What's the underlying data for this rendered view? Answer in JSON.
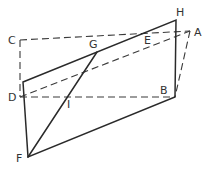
{
  "diagram": {
    "type": "geometry-figure",
    "points": {
      "A": {
        "label": "A",
        "x": 190,
        "y": 31
      },
      "B": {
        "label": "B",
        "x": 175,
        "y": 97
      },
      "C": {
        "label": "C",
        "x": 20,
        "y": 40
      },
      "D": {
        "label": "D",
        "x": 20,
        "y": 97
      },
      "E": {
        "label": "E",
        "x": 148,
        "y": 34
      },
      "F": {
        "label": "F",
        "x": 28,
        "y": 157
      },
      "G": {
        "label": "G",
        "x": 97,
        "y": 52
      },
      "H": {
        "label": "H",
        "x": 176,
        "y": 20
      },
      "I": {
        "label": "I",
        "x": 70,
        "y": 97
      }
    },
    "solid_segments": [
      [
        "P1",
        "H"
      ],
      [
        "H",
        "B"
      ],
      [
        "B",
        "F"
      ],
      [
        "F",
        "P1"
      ],
      [
        "F",
        "G"
      ]
    ],
    "dashed_segments": [
      [
        "C",
        "A"
      ],
      [
        "C",
        "D"
      ],
      [
        "D",
        "B"
      ],
      [
        "D",
        "A"
      ],
      [
        "A",
        "B"
      ]
    ],
    "labels": [
      "A",
      "B",
      "C",
      "D",
      "E",
      "F",
      "G",
      "H",
      "I"
    ]
  }
}
